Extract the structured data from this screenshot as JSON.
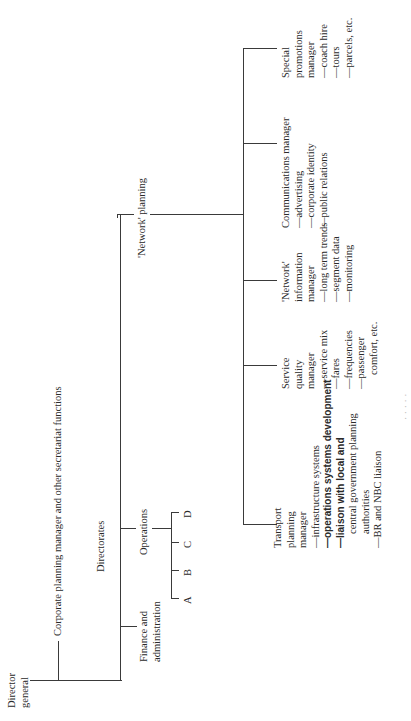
{
  "chart": {
    "orientation": "rotated -90deg (reads bottom-to-top)",
    "root": {
      "label_line1": "Director",
      "label_line2": "general"
    },
    "staff": {
      "label": "Corporate planning manager and other secretariat functions"
    },
    "directorates_label": "Directorates",
    "directorates": [
      {
        "line1": "Finance and",
        "line2": "administration"
      },
      {
        "line1": "Operations",
        "divisions": [
          "A",
          "B",
          "C",
          "D"
        ]
      },
      {
        "line1": "'Network' planning"
      }
    ],
    "network_planning_managers": [
      {
        "title": [
          "Transport",
          "planning",
          "manager"
        ],
        "duties": [
          "—infrastructure systems",
          "—operations systems development",
          "—liaison with local and",
          "central government planning",
          "authorities",
          "—BR and NBC liaison"
        ]
      },
      {
        "title": [
          "Service",
          "quality",
          "manager"
        ],
        "duties": [
          "—service mix",
          "—fares",
          "—frequencies",
          "—passenger",
          "comfort, etc."
        ]
      },
      {
        "title": [
          "'Network'",
          "information",
          "manager"
        ],
        "duties": [
          "—long term trends",
          "—segment data",
          "—monitoring"
        ]
      },
      {
        "title": [
          "Communications manager"
        ],
        "duties": [
          "—advertising",
          "—corporate identity",
          "—public relations"
        ]
      },
      {
        "title": [
          "Special",
          "promotions",
          "manager"
        ],
        "duties": [
          "—coach hire",
          "—tours",
          "—parcels, etc."
        ]
      }
    ],
    "caption_fragment": "· ·   ·    ·   ·"
  }
}
